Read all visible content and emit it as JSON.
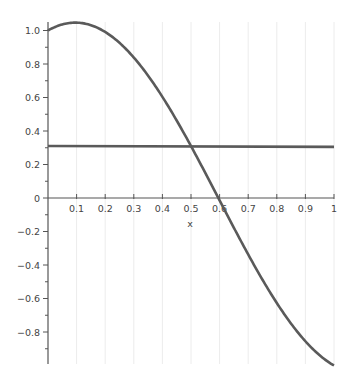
{
  "chart_data": {
    "type": "line",
    "title": "",
    "xlabel": "x",
    "ylabel": "",
    "xlim": [
      0,
      1
    ],
    "ylim": [
      -1.0,
      1.05
    ],
    "grid": {
      "vertical": true,
      "horizontal": false
    },
    "x_ticks": [
      "0.1",
      "0.2",
      "0.3",
      "0.4",
      "0.5",
      "0.6",
      "0.7",
      "0.8",
      "0.9",
      "1"
    ],
    "y_ticks": [
      "1.0",
      "0.8",
      "0.6",
      "0.4",
      "0.2",
      "0",
      "-0.2",
      "-0.4",
      "-0.6",
      "-0.8"
    ],
    "series": [
      {
        "name": "curve",
        "color": "#5a5a5a",
        "x": [
          0,
          0.05,
          0.1,
          0.15,
          0.2,
          0.25,
          0.3,
          0.35,
          0.4,
          0.45,
          0.5,
          0.55,
          0.6,
          0.65,
          0.7,
          0.75,
          0.8,
          0.85,
          0.9,
          0.95,
          1.0
        ],
        "y": [
          1.0,
          1.036,
          1.047,
          1.032,
          0.991,
          0.926,
          0.839,
          0.731,
          0.604,
          0.463,
          0.31,
          0.15,
          -0.014,
          -0.178,
          -0.337,
          -0.488,
          -0.627,
          -0.751,
          -0.855,
          -0.939,
          -1.0
        ]
      },
      {
        "name": "constant",
        "color": "#5a5a5a",
        "x": [
          0,
          1
        ],
        "y": [
          0.31,
          0.305
        ]
      }
    ]
  }
}
